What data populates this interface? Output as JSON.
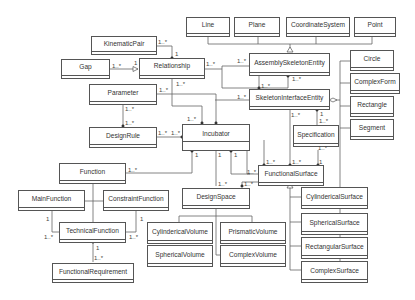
{
  "diagram": {
    "type": "UML class diagram",
    "classes": {
      "line": "Line",
      "plane": "Plane",
      "coordinate_system": "CoordinateSystem",
      "point": "Point",
      "kinematic_pair": "KinematicPair",
      "gap": "Gap",
      "relationship": "Relationship",
      "assembly_skeleton_entity": "AssemblySkeletonEntity",
      "skeleton_interface_entity": "SkeletonInterfaceEntity",
      "parameter": "Parameter",
      "design_rule": "DesignRule",
      "incubator": "Incubator",
      "specification": "Specification",
      "circle": "Circle",
      "complex_form": "ComplexForm",
      "rectangle": "Rectangle",
      "segment": "Segment",
      "function": "Function",
      "main_function": "MainFunction",
      "constraint_function": "ConstraintFunction",
      "technical_function": "TechnicalFunction",
      "functional_requirement": "FunctionalRequirement",
      "design_space": "DesignSpace",
      "functional_surface": "FunctionalSurface",
      "cylinderical_volume": "CylindericalVolume",
      "prismatic_volume": "PrismaticVolume",
      "spherical_volume": "SphericalVolume",
      "complex_volume": "ComplexVolume",
      "cylinderical_surface": "CylindericalSurface",
      "spherical_surface": "SphericalSurface",
      "rectangular_surface": "RectangularSurface",
      "complex_surface": "ComplexSurface"
    },
    "multiplicities": {
      "kp_rel_a": "1..*",
      "kp_rel_b": "1",
      "gap_rel_a": "1..*",
      "gap_rel_b": "1",
      "rel_ase_a": "1..*",
      "rel_ase_b": "1..*",
      "rel_inc": "1..*",
      "param_dr_a": "1..*",
      "param_dr_b": "1..*",
      "param_inc": "1..*",
      "dr_inc_a": "1..*",
      "dr_inc_b": "1..*",
      "inc_top": "1..*",
      "ase_sie_a": "1..*",
      "ase_sie_b": "1..*",
      "sie_left": "1..*",
      "sie_fs": "1..*",
      "sie_spec_a": "1",
      "sie_spec_b": "1..*",
      "spec_fs_a": "1..*",
      "spec_fs_b": "1",
      "inc_fs_a": "1..*",
      "inc_func_a": "1",
      "inc_func_b": "1..*",
      "inc_ds_a": "1",
      "inc_ds_b": "1..*",
      "inc_fs_c": "1",
      "inc_fs_d": "1..*",
      "ds_fs": "1..*",
      "mf_tf_a": "1",
      "mf_tf_b": "1..*",
      "cf_tf_a": "1",
      "cf_tf_b": "1..*",
      "tf_fr_a": "1",
      "tf_fr_b": "1..*"
    }
  }
}
